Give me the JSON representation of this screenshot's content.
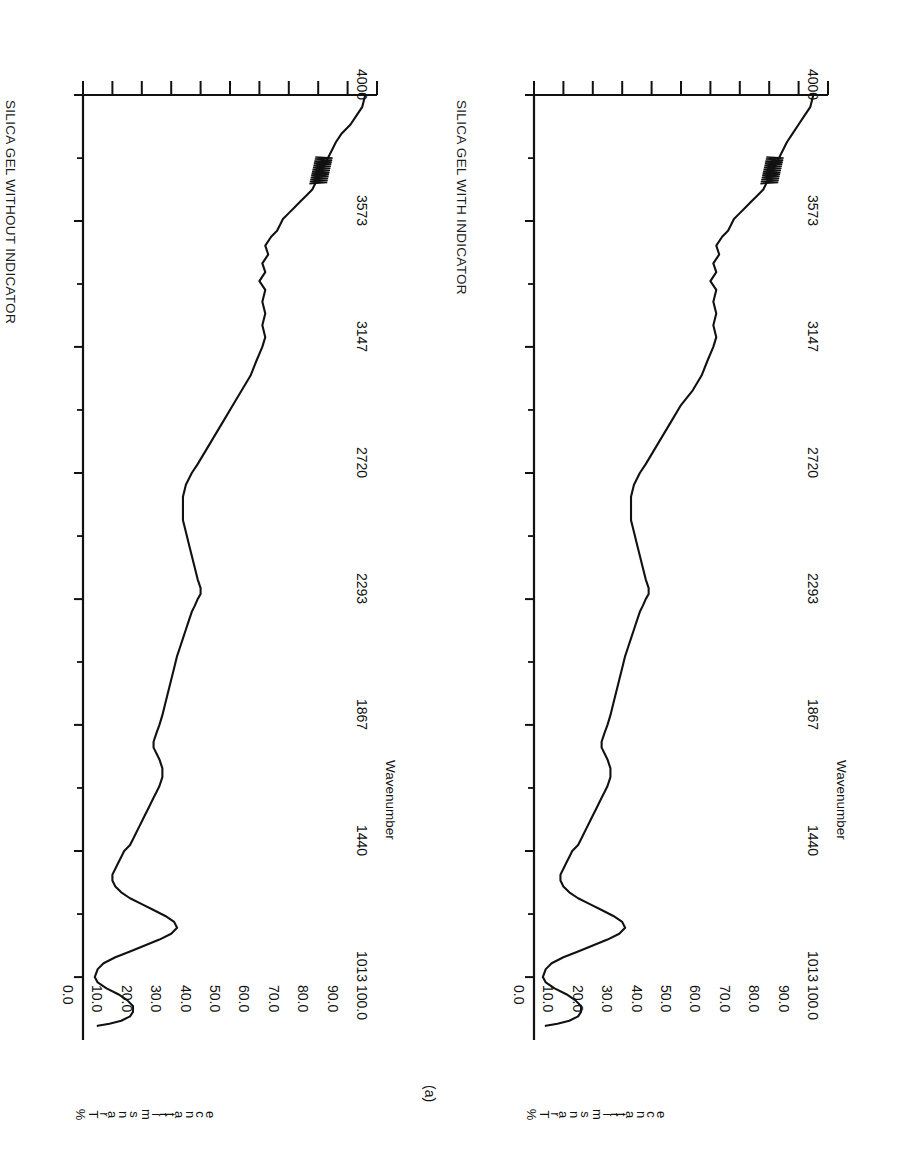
{
  "figure": {
    "panel_label": "(a)",
    "orientation_note": "page rotated 90 degrees",
    "ink_color": "#111111",
    "background_color": "#ffffff"
  },
  "panels": [
    {
      "id": "a",
      "title": "SILICA GEL WITHOUT INDICATOR",
      "y_axis_title_chars": [
        "%",
        "T",
        "r",
        "a",
        "n",
        "s",
        "m",
        "i",
        "t",
        "t",
        "a",
        "n",
        "c",
        "e"
      ],
      "y_axis_title": "%Transmittance",
      "x_axis_title": "Wavenumber"
    },
    {
      "id": "b",
      "title": "SILICA GEL WITH INDICATOR",
      "y_axis_title_chars": [
        "%",
        "T",
        "r",
        "a",
        "n",
        "s",
        "m",
        "i",
        "t",
        "t",
        "a",
        "n",
        "c",
        "e"
      ],
      "y_axis_title": "%Transmittance",
      "x_axis_title": "Wavenumber"
    }
  ],
  "chart_data": [
    {
      "type": "line",
      "title": "SILICA GEL WITHOUT INDICATOR",
      "panel_label": "(a)",
      "xlabel": "Wavenumber",
      "ylabel": "%Transmittance",
      "xlim": [
        4000,
        800
      ],
      "ylim": [
        0.0,
        100.0
      ],
      "x_ticks": [
        4000,
        3573,
        3147,
        2720,
        2293,
        1867,
        1440,
        1013
      ],
      "x_tick_labels": [
        "4000",
        "3573",
        "3147",
        "2720",
        "2293",
        "1867",
        "1440",
        "1013"
      ],
      "y_ticks": [
        0.0,
        10.0,
        20.0,
        30.0,
        40.0,
        50.0,
        60.0,
        70.0,
        80.0,
        90.0,
        100.0
      ],
      "y_tick_labels": [
        "0.0",
        "10.0",
        "20.0",
        "30.0",
        "40.0",
        "50.0",
        "60.0",
        "70.0",
        "80.0",
        "90.0",
        "100.0"
      ],
      "grid": false,
      "legend": "none",
      "series": [
        {
          "name": "silica gel without indicator",
          "x": [
            4000,
            3960,
            3930,
            3900,
            3870,
            3840,
            3820,
            3800,
            3780,
            3760,
            3740,
            3720,
            3700,
            3680,
            3660,
            3640,
            3620,
            3600,
            3580,
            3560,
            3540,
            3520,
            3490,
            3460,
            3430,
            3400,
            3370,
            3340,
            3300,
            3260,
            3220,
            3180,
            3147,
            3100,
            3050,
            3000,
            2950,
            2900,
            2850,
            2800,
            2750,
            2720,
            2680,
            2640,
            2600,
            2560,
            2520,
            2480,
            2440,
            2400,
            2360,
            2330,
            2310,
            2293,
            2270,
            2250,
            2220,
            2190,
            2160,
            2130,
            2100,
            2060,
            2020,
            1980,
            1940,
            1900,
            1867,
            1840,
            1810,
            1790,
            1770,
            1750,
            1720,
            1690,
            1660,
            1640,
            1620,
            1600,
            1580,
            1560,
            1540,
            1520,
            1500,
            1480,
            1460,
            1440,
            1420,
            1400,
            1380,
            1360,
            1340,
            1320,
            1300,
            1280,
            1260,
            1240,
            1220,
            1200,
            1180,
            1160,
            1140,
            1120,
            1100,
            1080,
            1060,
            1040,
            1013,
            995,
            975,
            955,
            935,
            915,
            895,
            880,
            865,
            855,
            848
          ],
          "y": [
            96,
            95,
            93,
            91,
            88,
            86,
            85,
            84,
            83,
            82,
            81,
            80,
            79,
            78,
            76,
            74,
            72,
            70,
            68,
            67,
            66,
            64,
            62,
            63,
            61,
            62,
            60,
            62,
            61,
            62,
            61,
            62,
            61,
            59,
            57,
            54,
            51,
            48,
            45,
            42,
            39,
            37,
            35,
            34,
            34,
            34,
            35,
            36,
            37,
            38,
            39,
            40,
            40,
            39,
            38,
            37,
            36,
            35,
            34,
            33,
            32,
            31,
            30,
            29,
            28,
            27,
            26,
            25,
            24,
            24,
            25,
            26,
            27,
            27,
            26,
            25,
            24,
            23,
            22,
            21,
            20,
            19,
            18,
            17,
            16,
            14,
            13,
            12,
            11,
            10,
            10,
            11,
            13,
            16,
            20,
            24,
            28,
            31,
            32,
            30,
            26,
            21,
            16,
            11,
            7,
            5,
            4,
            5,
            8,
            12,
            15,
            17,
            17,
            16,
            13,
            9,
            5
          ]
        }
      ]
    },
    {
      "type": "line",
      "title": "SILICA GEL WITH INDICATOR",
      "panel_label": "",
      "xlabel": "Wavenumber",
      "ylabel": "%Transmittance",
      "xlim": [
        4000,
        800
      ],
      "ylim": [
        0.0,
        100.0
      ],
      "x_ticks": [
        4000,
        3573,
        3147,
        2720,
        2293,
        1867,
        1440,
        1013
      ],
      "x_tick_labels": [
        "4000",
        "3573",
        "3147",
        "2720",
        "2293",
        "1867",
        "1440",
        "1013"
      ],
      "y_ticks": [
        0.0,
        10.0,
        20.0,
        30.0,
        40.0,
        50.0,
        60.0,
        70.0,
        80.0,
        90.0,
        100.0
      ],
      "y_tick_labels": [
        "0.0",
        "10.0",
        "20.0",
        "30.0",
        "40.0",
        "50.0",
        "60.0",
        "70.0",
        "80.0",
        "90.0",
        "100.0"
      ],
      "grid": false,
      "legend": "none",
      "series": [
        {
          "name": "silica gel with indicator",
          "x": [
            4000,
            3960,
            3930,
            3900,
            3870,
            3840,
            3820,
            3800,
            3780,
            3760,
            3740,
            3720,
            3700,
            3680,
            3660,
            3640,
            3620,
            3600,
            3580,
            3560,
            3540,
            3520,
            3490,
            3460,
            3430,
            3400,
            3370,
            3340,
            3300,
            3260,
            3220,
            3180,
            3147,
            3100,
            3050,
            3000,
            2950,
            2900,
            2850,
            2800,
            2750,
            2720,
            2680,
            2640,
            2600,
            2560,
            2520,
            2480,
            2440,
            2400,
            2360,
            2330,
            2310,
            2293,
            2270,
            2250,
            2220,
            2190,
            2160,
            2130,
            2100,
            2060,
            2020,
            1980,
            1940,
            1900,
            1867,
            1840,
            1810,
            1790,
            1770,
            1750,
            1720,
            1690,
            1660,
            1640,
            1620,
            1600,
            1580,
            1560,
            1540,
            1520,
            1500,
            1480,
            1460,
            1440,
            1420,
            1400,
            1380,
            1360,
            1340,
            1320,
            1300,
            1280,
            1260,
            1240,
            1220,
            1200,
            1180,
            1160,
            1140,
            1120,
            1100,
            1080,
            1060,
            1040,
            1013,
            995,
            975,
            955,
            935,
            915,
            895,
            880,
            865,
            855,
            848
          ],
          "y": [
            95,
            94,
            92,
            90,
            88,
            86,
            85,
            84,
            83,
            82,
            81,
            80,
            79,
            78,
            76,
            74,
            72,
            70,
            68,
            67,
            66,
            64,
            62,
            63,
            61,
            62,
            60,
            62,
            61,
            62,
            61,
            62,
            61,
            59,
            57,
            54,
            50,
            47,
            44,
            41,
            38,
            36,
            34,
            33,
            33,
            33,
            34,
            35,
            36,
            37,
            38,
            39,
            39,
            38,
            37,
            36,
            35,
            34,
            33,
            32,
            31,
            30,
            29,
            28,
            27,
            26,
            25,
            24,
            23,
            23,
            24,
            25,
            26,
            26,
            25,
            24,
            23,
            22,
            21,
            20,
            19,
            18,
            17,
            16,
            15,
            13,
            12,
            11,
            10,
            9,
            9,
            10,
            12,
            15,
            19,
            23,
            27,
            30,
            31,
            29,
            25,
            20,
            15,
            10,
            6,
            4,
            3,
            4,
            7,
            11,
            14,
            16,
            16,
            15,
            12,
            8,
            4
          ]
        }
      ]
    }
  ]
}
